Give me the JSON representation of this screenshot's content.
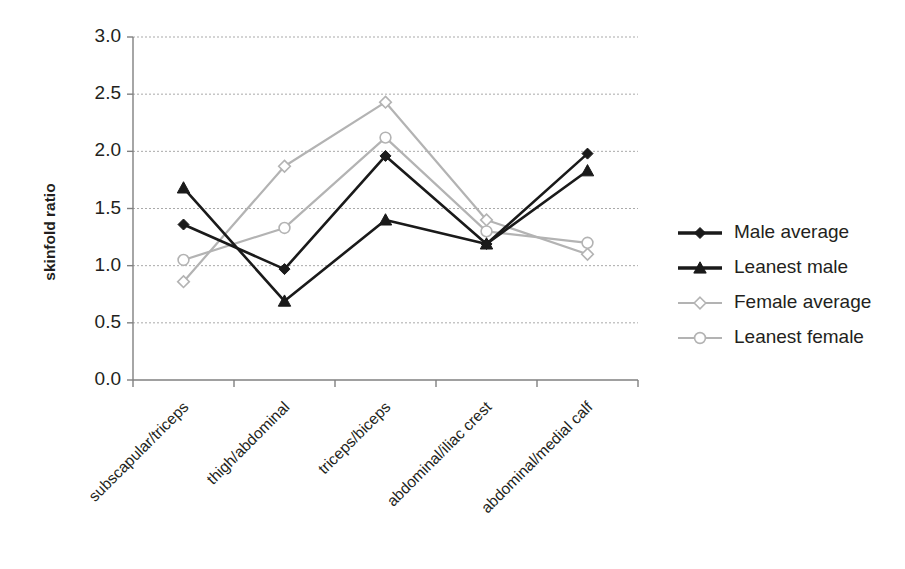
{
  "chart_data": {
    "type": "line",
    "title": "",
    "subtitle": "",
    "xlabel": "",
    "ylabel": "skinfold ratio",
    "ylim": [
      0.0,
      3.0
    ],
    "ytick_labels": [
      "0.0",
      "0.5",
      "1.0",
      "1.5",
      "2.0",
      "2.5",
      "3.0"
    ],
    "ytick_values": [
      0.0,
      0.5,
      1.0,
      1.5,
      2.0,
      2.5,
      3.0
    ],
    "grid": true,
    "grid_axis": "y",
    "legend_position": "right",
    "categories": [
      "subscapular/triceps",
      "thigh/abdominal",
      "triceps/biceps",
      "abdominal/iliac crest",
      "abdominal/medial calf"
    ],
    "series": [
      {
        "name": "Male average",
        "marker": "filled-diamond",
        "color": "#1a1a1a",
        "values": [
          1.36,
          0.97,
          1.96,
          1.19,
          1.98
        ]
      },
      {
        "name": "Leanest male",
        "marker": "filled-triangle",
        "color": "#1a1a1a",
        "values": [
          1.68,
          0.69,
          1.4,
          1.19,
          1.83
        ]
      },
      {
        "name": "Female average",
        "marker": "open-diamond",
        "color": "#b3b3b3",
        "values": [
          0.86,
          1.87,
          2.43,
          1.4,
          1.1
        ]
      },
      {
        "name": "Leanest female",
        "marker": "open-circle",
        "color": "#b3b3b3",
        "values": [
          1.05,
          1.33,
          2.12,
          1.3,
          1.2
        ]
      }
    ]
  },
  "legend": {
    "items": [
      {
        "label": "Male average"
      },
      {
        "label": "Leanest male"
      },
      {
        "label": "Female average"
      },
      {
        "label": "Leanest female"
      }
    ]
  },
  "axis": {
    "y_title": "skinfold ratio"
  },
  "colors": {
    "male": "#1a1a1a",
    "female": "#b3b3b3",
    "grid": "#a9a9a9",
    "axis": "#808080",
    "text": "#231f20",
    "background": "#ffffff"
  }
}
